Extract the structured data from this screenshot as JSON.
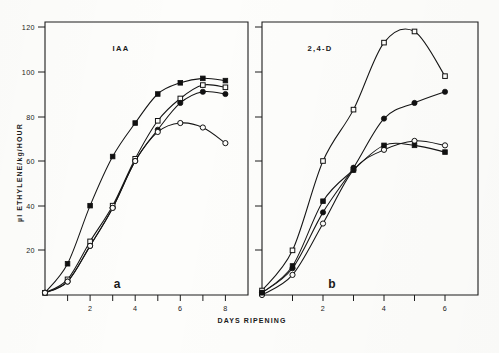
{
  "figure": {
    "y_axis_title": "µl ETHYLENE/kg/HOUR",
    "x_axis_title_left": "DAYS RIPENING",
    "x_axis_title_right": "DAYS RIPENING",
    "panel_a_label": "IAA",
    "panel_b_label": "2,4-D",
    "panel_a_letter": "a",
    "panel_b_letter": "b",
    "y_ticks": [
      "20",
      "40",
      "60",
      "80",
      "100",
      "120"
    ],
    "x_ticks_left": [
      "2",
      "4",
      "6",
      "8"
    ],
    "x_ticks_right": [
      "2",
      "4",
      "6"
    ],
    "ink_color": "#151515",
    "paper_color": "#fdfdfb"
  },
  "chart_data": [
    {
      "type": "line",
      "title": "IAA",
      "panel": "a",
      "xlabel": "DAYS RIPENING",
      "ylabel": "µl ETHYLENE/kg/HOUR",
      "xlim": [
        0,
        9
      ],
      "ylim": [
        0,
        120
      ],
      "grid": false,
      "legend": "none",
      "series": [
        {
          "name": "filled-square",
          "marker": "filled-square",
          "x": [
            0,
            1,
            2,
            3,
            4,
            5,
            6,
            7,
            8
          ],
          "y": [
            1,
            14,
            40,
            62,
            77,
            90,
            95,
            97,
            96
          ]
        },
        {
          "name": "open-square",
          "marker": "open-square",
          "x": [
            0,
            1,
            2,
            3,
            4,
            5,
            6,
            7,
            8
          ],
          "y": [
            1,
            7,
            24,
            40,
            61,
            78,
            88,
            94,
            93
          ]
        },
        {
          "name": "filled-circle",
          "marker": "filled-circle",
          "x": [
            0,
            1,
            2,
            3,
            4,
            5,
            6,
            7,
            8
          ],
          "y": [
            1,
            6,
            22,
            39,
            60,
            74,
            86,
            91,
            90
          ]
        },
        {
          "name": "open-circle",
          "marker": "open-circle",
          "x": [
            0,
            1,
            2,
            3,
            4,
            5,
            6,
            7,
            8
          ],
          "y": [
            1,
            6,
            22,
            39,
            60,
            73,
            77,
            75,
            68
          ]
        }
      ]
    },
    {
      "type": "line",
      "title": "2,4-D",
      "panel": "b",
      "xlabel": "DAYS RIPENING",
      "ylabel": "µl ETHYLENE/kg/HOUR",
      "xlim": [
        0,
        7
      ],
      "ylim": [
        0,
        120
      ],
      "grid": false,
      "legend": "none",
      "series": [
        {
          "name": "open-square",
          "marker": "open-square",
          "x": [
            0,
            1,
            2,
            3,
            4,
            5,
            6
          ],
          "y": [
            2,
            20,
            60,
            83,
            113,
            118,
            98
          ]
        },
        {
          "name": "filled-circle",
          "marker": "filled-circle",
          "x": [
            0,
            1,
            2,
            3,
            4,
            5,
            6
          ],
          "y": [
            1,
            12,
            37,
            57,
            79,
            86,
            91
          ]
        },
        {
          "name": "open-circle",
          "marker": "open-circle",
          "x": [
            0,
            1,
            2,
            3,
            4,
            5,
            6
          ],
          "y": [
            0,
            9,
            32,
            56,
            65,
            69,
            67
          ]
        },
        {
          "name": "filled-square",
          "marker": "filled-square",
          "x": [
            0,
            1,
            2,
            3,
            4,
            5,
            6
          ],
          "y": [
            1,
            13,
            42,
            56,
            67,
            67,
            64
          ]
        }
      ]
    }
  ]
}
